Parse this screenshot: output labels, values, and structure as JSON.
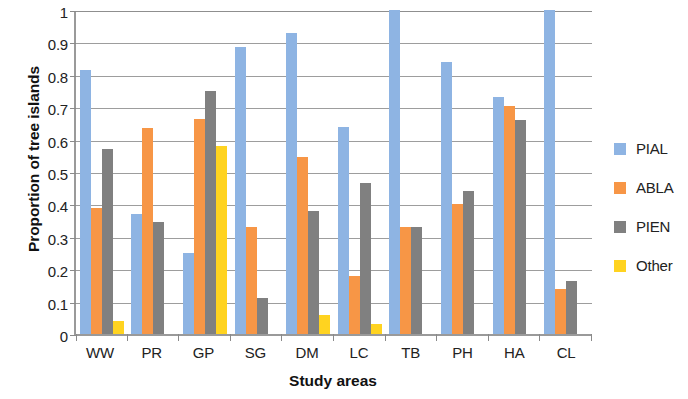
{
  "chart_data": {
    "type": "bar",
    "title": "",
    "xlabel": "Study areas",
    "ylabel": "Proportion of tree islands",
    "categories": [
      "WW",
      "PR",
      "GP",
      "SG",
      "DM",
      "LC",
      "TB",
      "PH",
      "HA",
      "CL"
    ],
    "ylim": [
      0,
      1
    ],
    "yticks": [
      0,
      0.1,
      0.2,
      0.3,
      0.4,
      0.5,
      0.6,
      0.7,
      0.8,
      0.9,
      1
    ],
    "ytick_labels": [
      "0",
      "0.1",
      "0.2",
      "0.3",
      "0.4",
      "0.5",
      "0.6",
      "0.7",
      "0.8",
      "0.9",
      "1"
    ],
    "grid": true,
    "legend_position": "right",
    "series": [
      {
        "name": "PIAL",
        "color": "#8EB4E3",
        "values": [
          0.815,
          0.37,
          0.25,
          0.885,
          0.93,
          0.64,
          1.0,
          0.84,
          0.73,
          1.0
        ]
      },
      {
        "name": "ABLA",
        "color": "#F79646",
        "values": [
          0.39,
          0.635,
          0.665,
          0.33,
          0.545,
          0.18,
          0.33,
          0.4,
          0.705,
          0.14
        ]
      },
      {
        "name": "PIEN",
        "color": "#808080",
        "values": [
          0.57,
          0.345,
          0.75,
          0.11,
          0.38,
          0.465,
          0.33,
          0.44,
          0.66,
          0.165
        ]
      },
      {
        "name": "Other",
        "color": "#FFD320",
        "values": [
          0.04,
          0,
          0.58,
          0,
          0.06,
          0.03,
          0,
          0,
          0,
          0
        ]
      }
    ]
  }
}
